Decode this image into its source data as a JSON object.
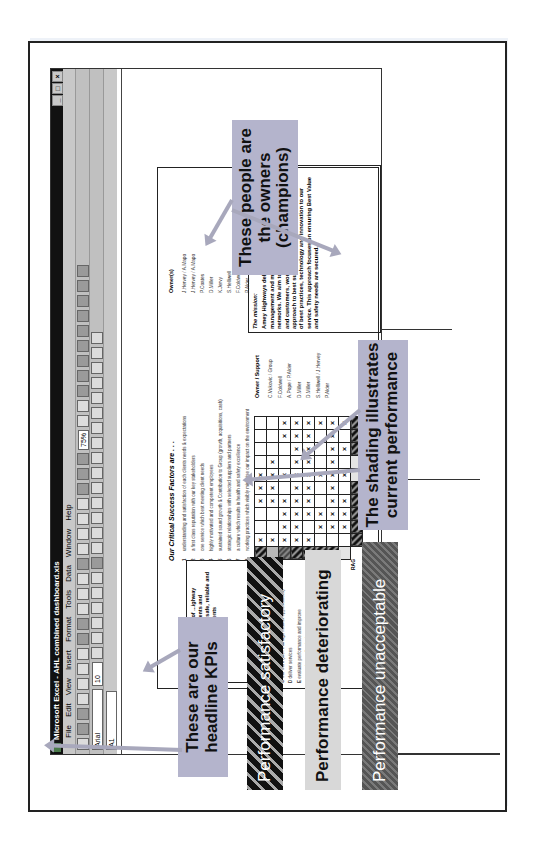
{
  "excel": {
    "title": "Microsoft Excel - AHL combined dashboard.xls",
    "menu": [
      "File",
      "Edit",
      "View",
      "Insert",
      "Format",
      "Tools",
      "Data",
      "Window",
      "Help"
    ],
    "font_name": "Arial",
    "font_size": "10",
    "zoom": "75%",
    "name_box": "A1"
  },
  "dashboard": {
    "mission_short": "...t successful provider of ...ighway services, supporting clients and ...customers to achieve safe, reliable and efficient road environments",
    "csf_title": "Our Critical Success Factors are . . .",
    "csf": [
      {
        "n": "1",
        "text": "understanding and satisfaction of each clients needs & expectations"
      },
      {
        "n": "2",
        "text": "a first class reputation with our key stakeholders"
      },
      {
        "n": "3",
        "text": "one service which best meeting client needs"
      },
      {
        "n": "4",
        "text": "highly motivated and competent employees"
      },
      {
        "n": "5",
        "text": "sustained sound growth & Contribution to Group (growth, acquisitions, cash)"
      },
      {
        "n": "6",
        "text": "strategic relationships with selected suppliers and partners"
      },
      {
        "n": "7",
        "text": "a culture which results in health and safety excellence"
      },
      {
        "n": "8",
        "text": "working practices which visibly minimise our impact on the environment"
      }
    ],
    "owner_title": "Owner(s)",
    "owners": [
      "J.Hervey / A.Mapo",
      "J.Hervey / A.Mapo",
      "P.Coates",
      "D.Miller",
      "K.Jervy",
      "S.Helliwell",
      "F.Coldwell",
      "P.Alder"
    ],
    "kp_title": "Our key processes are to . . .",
    "key_processes": [
      {
        "l": "",
        "text": "and policies"
      },
      {
        "l": "C",
        "text": "win work (incl. manage market opportunities)"
      },
      {
        "l": "D",
        "text": "deliver services"
      },
      {
        "l": "E",
        "text": "evaluate performance and improve"
      },
      {
        "l": "",
        "text": "communicate effectively"
      },
      {
        "l": "H",
        "text": "manage finances"
      },
      {
        "l": "I",
        "text": "procure resources"
      }
    ],
    "processes_label": "Processes",
    "rag_label": "RAG",
    "support_title": "Owner / Support",
    "support": [
      "C.Vukovic / Group",
      "F.Coldwell",
      "A.Pope / P.Alder",
      "D.Miller",
      "D.Miller",
      "S.Helliwell / J.Hervey",
      "P.Alder"
    ],
    "mission_title": "The mission:",
    "mission_text": "Amey Highways delivers a comprehensive service in the management and maintenance of national and local road networks. We aim to be the preferred choice of clients and customers, working alongside them and tailoring our approach to best suit their needs through the application of best practices, technology and innovation to our service. This approach focuses on ensuring Best Value and safety needs are secured."
  },
  "grid": {
    "rows": 8,
    "cols": 10,
    "rag_row_shading": [
      "dark",
      "dark",
      "dark",
      "dark",
      "dark",
      "light",
      "light",
      "dark",
      "dark",
      "dark"
    ],
    "rag_col_shading": [
      "dark",
      "grey",
      "mid",
      "dark",
      "dark",
      "dark",
      "dark",
      "light"
    ],
    "marks": [
      [
        1,
        0,
        0,
        1,
        1,
        1,
        0,
        0,
        0,
        0
      ],
      [
        1,
        0,
        0,
        1,
        1,
        1,
        1,
        0,
        0,
        0
      ],
      [
        1,
        1,
        1,
        1,
        0,
        1,
        0,
        0,
        1,
        1
      ],
      [
        1,
        1,
        1,
        1,
        1,
        1,
        1,
        1,
        1,
        1
      ],
      [
        1,
        0,
        1,
        1,
        1,
        1,
        1,
        1,
        1,
        1
      ],
      [
        0,
        1,
        1,
        0,
        0,
        1,
        0,
        0,
        0,
        1
      ],
      [
        0,
        1,
        1,
        1,
        1,
        1,
        1,
        1,
        1,
        1
      ],
      [
        0,
        1,
        1,
        1,
        0,
        1,
        0,
        1,
        0,
        1
      ]
    ],
    "mark_glyph": "×"
  },
  "callouts": {
    "owners": "These people are the owners (champions)",
    "shading": "The shading illustrates current performance",
    "kpis": "These are our headline KPIs"
  },
  "legend": {
    "satisfactory": "Performance satisfactory",
    "deteriorating": "Performance deteriorating",
    "unacceptable": "Performance unacceptable"
  }
}
